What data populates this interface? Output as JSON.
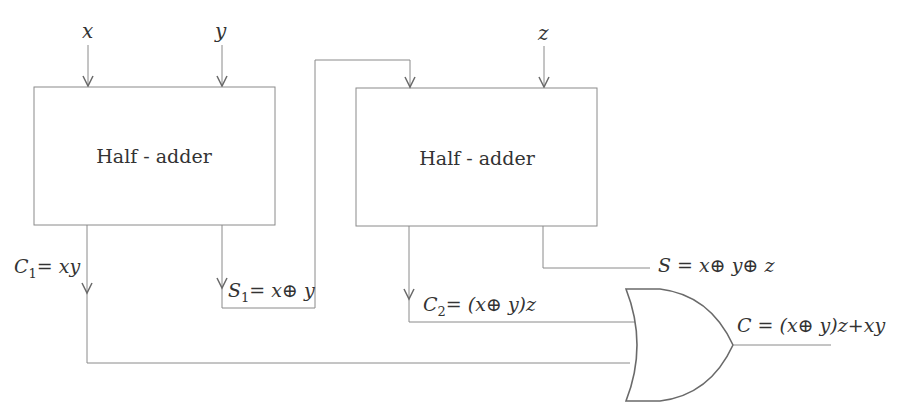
{
  "diagram": {
    "type": "full-adder-from-half-adders",
    "inputs": [
      {
        "id": "x",
        "label": "x"
      },
      {
        "id": "y",
        "label": "y"
      },
      {
        "id": "z",
        "label": "z"
      }
    ],
    "blocks": [
      {
        "id": "ha1",
        "label": "Half - adder"
      },
      {
        "id": "ha2",
        "label": "Half - adder"
      },
      {
        "id": "or",
        "label": "",
        "kind": "OR gate"
      }
    ],
    "signals": {
      "c1": {
        "name": "C",
        "sub": "1",
        "expr": "= xy"
      },
      "s1": {
        "name": "S",
        "sub": "1",
        "expr": "= x⊕ y"
      },
      "c2": {
        "name": "C",
        "sub": "2",
        "expr": "= (x⊕ y)z"
      },
      "s": {
        "label": "S = x⊕ y⊕ z"
      },
      "c": {
        "label": "C = (x⊕ y)z+xy"
      }
    },
    "colors": {
      "wire": "#8a8a8a",
      "gate": "#6a6a6a",
      "text": "#333333"
    }
  }
}
